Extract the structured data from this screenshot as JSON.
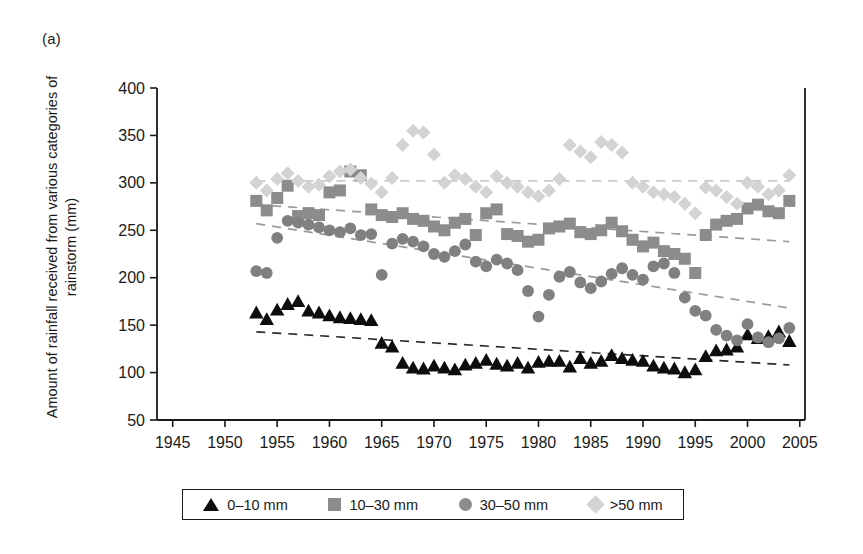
{
  "panel": {
    "label": "(a)"
  },
  "legend": {
    "entries": [
      {
        "label": "0–10 mm",
        "marker": "triangle-marker",
        "color": "#0d0d0d"
      },
      {
        "label": "10–30 mm",
        "marker": "square-marker",
        "color": "#8c8c8c"
      },
      {
        "label": "30–50 mm",
        "marker": "circle-marker",
        "color": "#8c8c8c"
      },
      {
        "label": ">50 mm",
        "marker": "diamond-marker",
        "color": "#d3d3d3"
      }
    ]
  },
  "chart_data": {
    "type": "scatter",
    "title": "",
    "subtitle": "",
    "xlabel": "",
    "ylabel": "Amount of rainfall received from various categories of rainstorm (mm)",
    "xlim": [
      1943.5,
      2005.5
    ],
    "ylim": [
      50,
      400
    ],
    "xticks": [
      1945,
      1950,
      1955,
      1960,
      1965,
      1970,
      1975,
      1980,
      1985,
      1990,
      1995,
      2000,
      2005
    ],
    "yticks": [
      50,
      100,
      150,
      200,
      250,
      300,
      350,
      400
    ],
    "grid": false,
    "legend_position": "bottom",
    "series": [
      {
        "name": "0–10 mm",
        "marker": "triangle",
        "color": "#0d0d0d",
        "x": [
          1953,
          1954,
          1955,
          1956,
          1957,
          1958,
          1959,
          1960,
          1961,
          1962,
          1963,
          1964,
          1965,
          1966,
          1967,
          1968,
          1969,
          1970,
          1971,
          1972,
          1973,
          1974,
          1975,
          1976,
          1977,
          1978,
          1979,
          1980,
          1981,
          1982,
          1983,
          1984,
          1985,
          1986,
          1987,
          1988,
          1989,
          1990,
          1991,
          1992,
          1993,
          1994,
          1995,
          1996,
          1997,
          1998,
          1999,
          2000,
          2001,
          2002,
          2003,
          2004
        ],
        "values": [
          163,
          156,
          166,
          172,
          175,
          165,
          163,
          160,
          158,
          157,
          156,
          155,
          131,
          127,
          110,
          105,
          104,
          107,
          105,
          103,
          108,
          110,
          113,
          109,
          107,
          110,
          105,
          111,
          112,
          112,
          106,
          115,
          110,
          112,
          118,
          115,
          113,
          112,
          107,
          105,
          104,
          100,
          103,
          117,
          123,
          124,
          127,
          140,
          136,
          138,
          143,
          133
        ],
        "trend": {
          "type": "linear-dashed",
          "x": [
            1953,
            2004
          ],
          "y": [
            143,
            108
          ]
        }
      },
      {
        "name": "10–30 mm",
        "marker": "square",
        "color": "#8c8c8c",
        "x": [
          1953,
          1954,
          1955,
          1956,
          1957,
          1958,
          1959,
          1960,
          1961,
          1962,
          1963,
          1964,
          1965,
          1966,
          1967,
          1968,
          1969,
          1970,
          1971,
          1972,
          1973,
          1974,
          1975,
          1976,
          1977,
          1978,
          1979,
          1980,
          1981,
          1982,
          1983,
          1984,
          1985,
          1986,
          1987,
          1988,
          1989,
          1990,
          1991,
          1992,
          1993,
          1994,
          1995,
          1996,
          1997,
          1998,
          1999,
          2000,
          2001,
          2002,
          2003,
          2004
        ],
        "values": [
          281,
          271,
          284,
          297,
          265,
          268,
          266,
          290,
          292,
          312,
          308,
          272,
          266,
          264,
          268,
          262,
          260,
          254,
          250,
          258,
          262,
          245,
          268,
          272,
          246,
          244,
          238,
          240,
          252,
          254,
          257,
          248,
          246,
          250,
          258,
          249,
          240,
          233,
          237,
          228,
          225,
          220,
          205,
          245,
          256,
          260,
          262,
          273,
          277,
          270,
          268,
          281
        ],
        "trend": {
          "type": "linear-dashed",
          "x": [
            1953,
            2004
          ],
          "y": [
            277,
            238
          ]
        }
      },
      {
        "name": "30–50 mm",
        "marker": "circle",
        "color": "#808080",
        "x": [
          1953,
          1954,
          1955,
          1956,
          1957,
          1958,
          1959,
          1960,
          1961,
          1962,
          1963,
          1964,
          1965,
          1966,
          1967,
          1968,
          1969,
          1970,
          1971,
          1972,
          1973,
          1974,
          1975,
          1976,
          1977,
          1978,
          1979,
          1980,
          1981,
          1982,
          1983,
          1984,
          1985,
          1986,
          1987,
          1988,
          1989,
          1990,
          1991,
          1992,
          1993,
          1994,
          1995,
          1996,
          1997,
          1998,
          1999,
          2000,
          2001,
          2002,
          2003,
          2004
        ],
        "values": [
          207,
          205,
          242,
          260,
          258,
          256,
          253,
          250,
          248,
          252,
          245,
          246,
          203,
          236,
          241,
          238,
          233,
          225,
          222,
          228,
          235,
          217,
          212,
          219,
          215,
          208,
          186,
          159,
          182,
          201,
          206,
          195,
          189,
          196,
          204,
          210,
          203,
          198,
          212,
          215,
          205,
          179,
          165,
          160,
          145,
          139,
          134,
          151,
          137,
          132,
          136,
          147
        ],
        "trend": {
          "type": "linear-dashed",
          "x": [
            1953,
            2004
          ],
          "y": [
            257,
            168
          ]
        }
      },
      {
        "name": ">50 mm",
        "marker": "diamond",
        "color": "#d3d3d3",
        "x": [
          1953,
          1954,
          1955,
          1956,
          1957,
          1958,
          1959,
          1960,
          1961,
          1962,
          1963,
          1964,
          1965,
          1966,
          1967,
          1968,
          1969,
          1970,
          1971,
          1972,
          1973,
          1974,
          1975,
          1976,
          1977,
          1978,
          1979,
          1980,
          1981,
          1982,
          1983,
          1984,
          1985,
          1986,
          1987,
          1988,
          1989,
          1990,
          1991,
          1992,
          1993,
          1994,
          1995,
          1996,
          1997,
          1998,
          1999,
          2000,
          2001,
          2002,
          2003,
          2004
        ],
        "values": [
          300,
          292,
          304,
          310,
          302,
          296,
          298,
          307,
          312,
          314,
          305,
          299,
          290,
          305,
          340,
          355,
          353,
          330,
          300,
          308,
          304,
          296,
          290,
          307,
          300,
          296,
          290,
          286,
          292,
          304,
          340,
          333,
          327,
          343,
          340,
          332,
          300,
          296,
          290,
          288,
          285,
          278,
          268,
          295,
          292,
          285,
          278,
          300,
          296,
          288,
          292,
          308
        ],
        "trend": {
          "type": "linear-dashed",
          "x": [
            1953,
            2004
          ],
          "y": [
            302,
            302
          ]
        }
      }
    ]
  }
}
